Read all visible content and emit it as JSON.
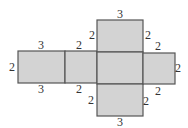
{
  "diagram": {
    "type": "net-of-rectangular-prism",
    "colors": {
      "fill": "#d3d3d3",
      "stroke": "#555555",
      "text": "#333333"
    },
    "faces": [
      {
        "name": "face-left",
        "x": 18,
        "y": 51,
        "w": 47,
        "h": 32
      },
      {
        "name": "face-middle-left",
        "x": 65,
        "y": 51,
        "w": 32,
        "h": 32
      },
      {
        "name": "face-top",
        "x": 97,
        "y": 20,
        "w": 46,
        "h": 32
      },
      {
        "name": "face-center",
        "x": 97,
        "y": 52,
        "w": 46,
        "h": 32
      },
      {
        "name": "face-bottom",
        "x": 97,
        "y": 84,
        "w": 46,
        "h": 32
      },
      {
        "name": "face-right",
        "x": 143,
        "y": 53,
        "w": 32,
        "h": 31
      }
    ],
    "labels": [
      {
        "text": "3",
        "x": 120,
        "y": 18
      },
      {
        "text": "2",
        "x": 92,
        "y": 39
      },
      {
        "text": "2",
        "x": 148,
        "y": 39
      },
      {
        "text": "3",
        "x": 41,
        "y": 49
      },
      {
        "text": "2",
        "x": 79,
        "y": 49
      },
      {
        "text": "2",
        "x": 158,
        "y": 50
      },
      {
        "text": "2",
        "x": 12,
        "y": 71
      },
      {
        "text": "2",
        "x": 178,
        "y": 72
      },
      {
        "text": "3",
        "x": 41,
        "y": 93
      },
      {
        "text": "2",
        "x": 79,
        "y": 93
      },
      {
        "text": "2",
        "x": 158,
        "y": 95
      },
      {
        "text": "2",
        "x": 91,
        "y": 104
      },
      {
        "text": "2",
        "x": 146,
        "y": 105
      },
      {
        "text": "3",
        "x": 120,
        "y": 126
      }
    ]
  }
}
